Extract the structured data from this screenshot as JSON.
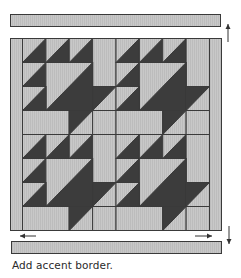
{
  "caption": "Add accent border.",
  "colors": {
    "light": "#c6c6c6",
    "dark": "#3c3c3c",
    "line": "#3a3a3a",
    "border": "#bdbdbd",
    "arrow": "#333333"
  },
  "strips": {
    "top": {
      "x": 10,
      "y": 14,
      "w": 210,
      "h": 12
    },
    "bottom": {
      "x": 11,
      "y": 241,
      "w": 210,
      "h": 12
    }
  },
  "arrows": [
    {
      "name": "up-arrow-icon",
      "dir": "up",
      "x": 228,
      "y1": 42,
      "y2": 24
    },
    {
      "name": "down-arrow-icon",
      "dir": "down",
      "x": 229,
      "y1": 226,
      "y2": 244
    },
    {
      "name": "left-arrow-icon",
      "dir": "left",
      "y": 236,
      "x1": 36,
      "x2": 20
    },
    {
      "name": "right-arrow-icon",
      "dir": "right",
      "y": 236,
      "x1": 195,
      "x2": 212
    }
  ],
  "quilt": {
    "x": 10,
    "y": 38,
    "w": 211,
    "h": 192,
    "side_border_width": 12,
    "grid": {
      "cols": 8,
      "rows": 8
    },
    "block_repeat": [
      2,
      2
    ],
    "block": [
      {
        "type": "hst",
        "c": 0,
        "r": 0,
        "cs": 1,
        "rs": 1
      },
      {
        "type": "hst",
        "c": 1,
        "r": 0,
        "cs": 1,
        "rs": 1
      },
      {
        "type": "hst",
        "c": 2,
        "r": 0,
        "cs": 1,
        "rs": 1
      },
      {
        "type": "light",
        "c": 3,
        "r": 0,
        "cs": 1,
        "rs": 2
      },
      {
        "type": "hst",
        "c": 0,
        "r": 1,
        "cs": 1,
        "rs": 1
      },
      {
        "type": "hst",
        "c": 1,
        "r": 1,
        "cs": 2,
        "rs": 2
      },
      {
        "type": "hst",
        "c": 0,
        "r": 2,
        "cs": 1,
        "rs": 1
      },
      {
        "type": "inv",
        "c": 3,
        "r": 2,
        "cs": 1,
        "rs": 1
      },
      {
        "type": "light",
        "c": 0,
        "r": 3,
        "cs": 2,
        "rs": 1
      },
      {
        "type": "inv",
        "c": 2,
        "r": 3,
        "cs": 1,
        "rs": 1
      },
      {
        "type": "light",
        "c": 3,
        "r": 3,
        "cs": 1,
        "rs": 1
      }
    ]
  }
}
